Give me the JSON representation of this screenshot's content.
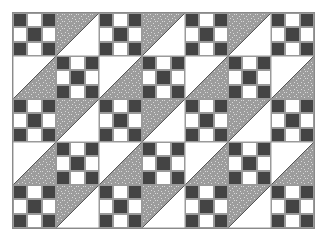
{
  "quilt": {
    "name": "nine-patch and half-square triangle quilt",
    "columns": 7,
    "rows": 5,
    "block_size_px": 43,
    "colors": {
      "dark": "#444444",
      "light": "#ffffff",
      "print": "#9c9c9c",
      "print_fleck": "#d8d8d8",
      "border": "#8a8a8a"
    },
    "ninepatch_layout": [
      "dark",
      "light",
      "dark",
      "light",
      "dark",
      "light",
      "dark",
      "light",
      "dark"
    ],
    "layout": [
      [
        "ninepatch",
        "tri-tl",
        "ninepatch",
        "tri-tl",
        "ninepatch",
        "tri-tl",
        "ninepatch"
      ],
      [
        "tri-br",
        "ninepatch",
        "tri-br",
        "ninepatch",
        "tri-br",
        "ninepatch",
        "tri-br"
      ],
      [
        "ninepatch",
        "tri-tl",
        "ninepatch",
        "tri-tl",
        "ninepatch",
        "tri-tl",
        "ninepatch"
      ],
      [
        "tri-br",
        "ninepatch",
        "tri-br",
        "ninepatch",
        "tri-br",
        "ninepatch",
        "tri-br"
      ],
      [
        "ninepatch",
        "tri-tl",
        "ninepatch",
        "tri-tl",
        "ninepatch",
        "tri-tl",
        "ninepatch"
      ]
    ]
  }
}
